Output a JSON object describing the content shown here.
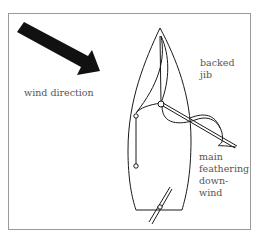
{
  "diagram": {
    "labels": {
      "wind_direction": "wind direction",
      "backed_jib_line1": "backed",
      "backed_jib_line2": "jib",
      "main_line1": "main",
      "main_line2": "feathering",
      "main_line3": "down-",
      "main_line4": "wind"
    },
    "colors": {
      "ink": "#1a1a1a",
      "frame": "#9a9a9a",
      "text": "#555555"
    },
    "icons": [
      "wind-arrow-icon",
      "sailboat-hull-icon",
      "mast-icon",
      "jib-sail-icon",
      "mainsail-icon",
      "boom-icon",
      "tiller-icon"
    ]
  }
}
